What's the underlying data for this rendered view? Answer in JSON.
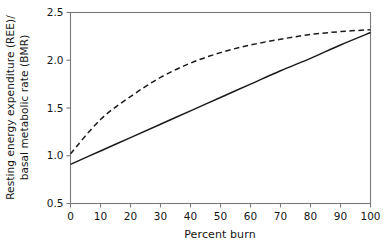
{
  "chart_data": {
    "type": "line",
    "title": "",
    "xlabel": "Percent burn",
    "ylabel": "Resting energy expenditure (REE)/ basal metabolic rate (BMR)",
    "ylabel_line1": "Resting energy expenditure (REE)/",
    "ylabel_line2": "basal metabolic rate (BMR)",
    "xlim": [
      0,
      100
    ],
    "ylim": [
      0.5,
      2.5
    ],
    "grid": false,
    "legend": "none",
    "xticks": [
      0,
      10,
      20,
      30,
      40,
      50,
      60,
      70,
      80,
      90,
      100
    ],
    "xticklabels": [
      "0",
      "10",
      "20",
      "30",
      "40",
      "50",
      "60",
      "70",
      "80",
      "90",
      "100"
    ],
    "yticks": [
      0.5,
      1.0,
      1.5,
      2.0,
      2.5
    ],
    "yticklabels": [
      "0.5",
      "1.0",
      "1.5",
      "2.0",
      "2.5"
    ],
    "x": [
      0,
      10,
      20,
      30,
      40,
      50,
      60,
      70,
      80,
      90,
      100
    ],
    "series": [
      {
        "name": "solid-curve",
        "style": "solid",
        "color": "#1a1a1a",
        "values": [
          0.91,
          1.05,
          1.19,
          1.33,
          1.47,
          1.61,
          1.75,
          1.89,
          2.02,
          2.16,
          2.29
        ]
      },
      {
        "name": "dashed-curve",
        "style": "dashed",
        "color": "#1a1a1a",
        "values": [
          1.02,
          1.38,
          1.62,
          1.82,
          1.97,
          2.08,
          2.16,
          2.22,
          2.27,
          2.3,
          2.32
        ]
      }
    ]
  },
  "axes": {
    "frame_color": "#7a7a7a",
    "tick_color": "#7a7a7a"
  }
}
